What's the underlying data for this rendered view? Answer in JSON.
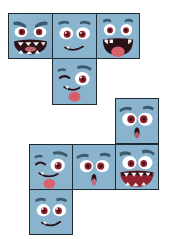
{
  "canvas": {
    "width": 171,
    "height": 239,
    "background_color": "#ffffff",
    "description": "Nine cartoon face tiles arranged as two cube-net clusters"
  },
  "palette": {
    "tile_fill": "#8ab4ce",
    "tile_fill_shadow": "#7aa6c2",
    "tile_border": "#1d2b33",
    "eye_white": "#ffffff",
    "iris": "#8f2430",
    "pupil": "#3a1018",
    "brow": "#3d5a6c",
    "mouth_dark": "#2a1218",
    "tongue": "#d9616b",
    "teeth": "#f7f4ee",
    "lip": "#b83a4a"
  },
  "tiles": [
    {
      "id": "tile-angry",
      "name": "angry-face-tile",
      "expression": "angry",
      "cluster": "top",
      "grid": {
        "row": 1,
        "col": 1
      },
      "x": 8,
      "y": 13,
      "w": 45,
      "h": 46
    },
    {
      "id": "tile-smirk",
      "name": "smirking-face-tile",
      "expression": "smirking",
      "cluster": "top",
      "grid": {
        "row": 1,
        "col": 2
      },
      "x": 52,
      "y": 13,
      "w": 45,
      "h": 46
    },
    {
      "id": "tile-laugh",
      "name": "laughing-face-tile",
      "expression": "laughing",
      "cluster": "top",
      "grid": {
        "row": 1,
        "col": 3
      },
      "x": 96,
      "y": 13,
      "w": 44,
      "h": 46
    },
    {
      "id": "tile-wink-tongue",
      "name": "winking-tongue-face-tile",
      "expression": "winking-tongue-out",
      "cluster": "top",
      "grid": {
        "row": 2,
        "col": 2
      },
      "x": 52,
      "y": 58,
      "w": 45,
      "h": 47
    },
    {
      "id": "tile-surprised-upper",
      "name": "surprised-face-tile-upper",
      "expression": "surprised",
      "cluster": "bottom",
      "grid": {
        "row": 1,
        "col": 3
      },
      "x": 115,
      "y": 98,
      "w": 44,
      "h": 46
    },
    {
      "id": "tile-silly",
      "name": "silly-tongue-face-tile",
      "expression": "silly-tongue-out",
      "cluster": "bottom",
      "grid": {
        "row": 2,
        "col": 1
      },
      "x": 29,
      "y": 144,
      "w": 44,
      "h": 46
    },
    {
      "id": "tile-surprised-lower",
      "name": "surprised-face-tile-lower",
      "expression": "surprised",
      "cluster": "bottom",
      "grid": {
        "row": 2,
        "col": 2
      },
      "x": 72,
      "y": 144,
      "w": 44,
      "h": 46
    },
    {
      "id": "tile-grin",
      "name": "grinning-face-tile",
      "expression": "grinning-teeth",
      "cluster": "bottom",
      "grid": {
        "row": 2,
        "col": 3
      },
      "x": 115,
      "y": 144,
      "w": 44,
      "h": 46
    },
    {
      "id": "tile-smile",
      "name": "smiling-face-tile",
      "expression": "smiling",
      "cluster": "bottom",
      "grid": {
        "row": 3,
        "col": 1
      },
      "x": 29,
      "y": 189,
      "w": 44,
      "h": 46
    }
  ]
}
